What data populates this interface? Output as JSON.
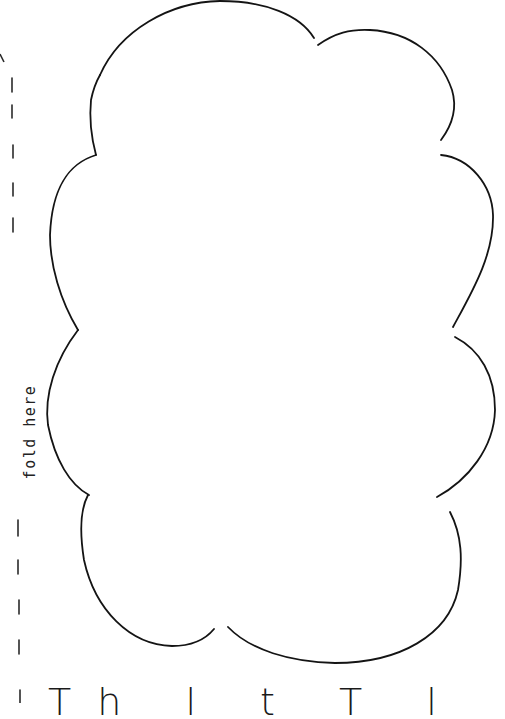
{
  "page": {
    "type": "printable-craft-template",
    "background": "#ffffff",
    "ink_color": "#1a1a1a"
  },
  "fold_guide": {
    "label": "fold here",
    "orientation": "vertical-rotated-90",
    "line_style": "dashed"
  },
  "cutout": {
    "shape": "cloud",
    "outline": "hand-drawn",
    "lobes": 8
  },
  "bottom_caption": {
    "visible_text": "Th   l t T l",
    "note": "partially cut off at bottom edge"
  }
}
